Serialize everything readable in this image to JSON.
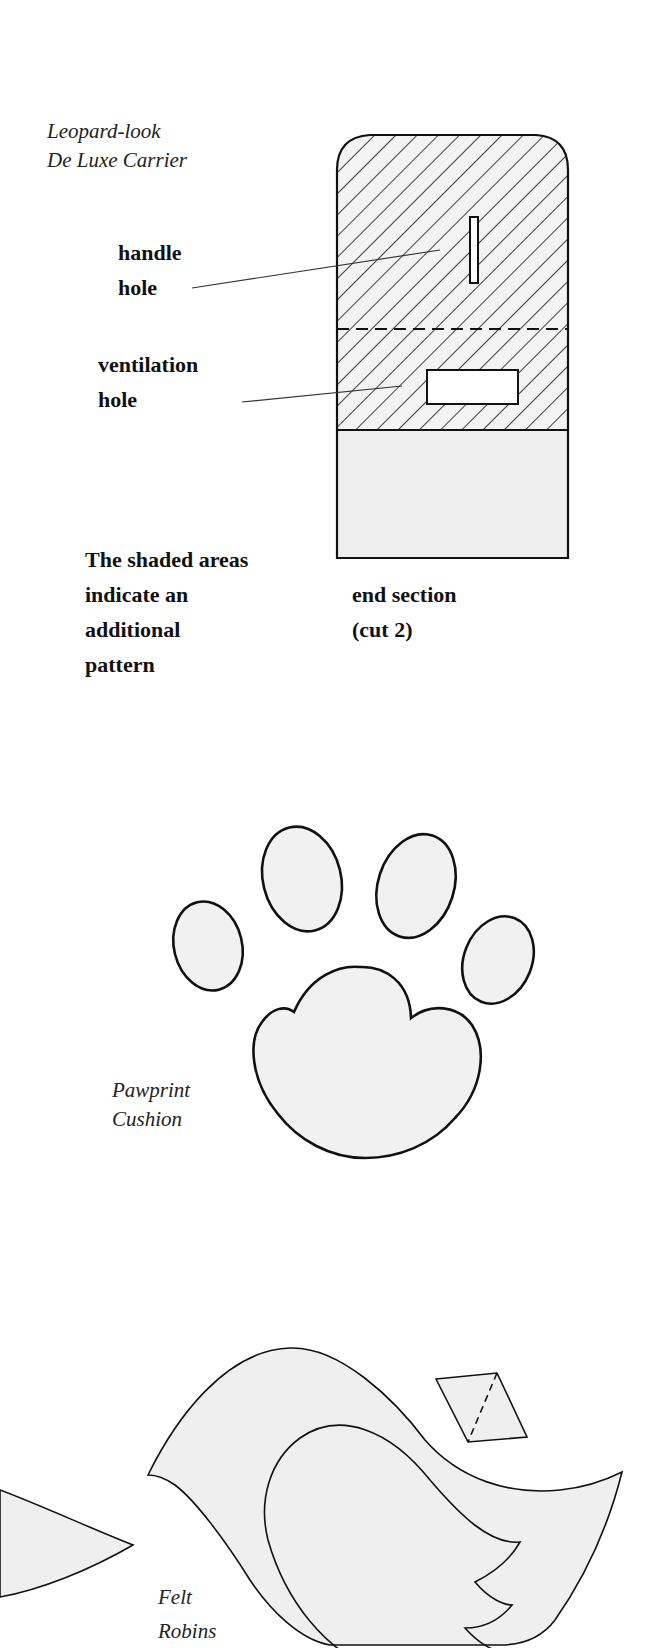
{
  "page": {
    "background": "#ffffff",
    "shape_fill": "#efefef",
    "line_color": "#111111"
  },
  "carrier": {
    "title_line1": "Leopard-look",
    "title_line2": "De Luxe Carrier",
    "callouts": [
      {
        "line1": "handle",
        "line2": "hole"
      },
      {
        "line1": "ventilation",
        "line2": "hole"
      }
    ],
    "note_lines": [
      "The shaded areas",
      "indicate an",
      "additional",
      "pattern"
    ],
    "part_label_line1": "end section",
    "part_label_line2": "(cut 2)"
  },
  "pawprint": {
    "title_line1": "Pawprint",
    "title_line2": "Cushion"
  },
  "robin": {
    "title_line1": "Felt",
    "title_line2": "Robins"
  }
}
